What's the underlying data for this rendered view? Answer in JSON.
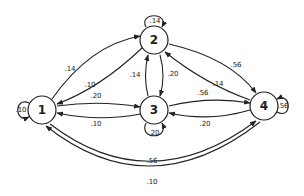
{
  "diagram": {
    "type": "markov-chain-state-transition",
    "nodes": [
      {
        "id": "1",
        "label": "1",
        "x": 42,
        "y": 110
      },
      {
        "id": "2",
        "label": "2",
        "x": 154,
        "y": 40
      },
      {
        "id": "3",
        "label": "3",
        "x": 154,
        "y": 110
      },
      {
        "id": "4",
        "label": "4",
        "x": 264,
        "y": 106
      }
    ],
    "edges": [
      {
        "from": "1",
        "to": "1",
        "label": ".10"
      },
      {
        "from": "1",
        "to": "2",
        "label": ".14"
      },
      {
        "from": "2",
        "to": "1",
        "label": ".10"
      },
      {
        "from": "1",
        "to": "3",
        "label": ".20"
      },
      {
        "from": "3",
        "to": "1",
        "label": ".10"
      },
      {
        "from": "2",
        "to": "2",
        "label": ".14"
      },
      {
        "from": "3",
        "to": "2",
        "label": ".14"
      },
      {
        "from": "2",
        "to": "3",
        "label": ".20"
      },
      {
        "from": "2",
        "to": "4",
        "label": ".56"
      },
      {
        "from": "4",
        "to": "2",
        "label": ".14"
      },
      {
        "from": "3",
        "to": "4",
        "label": ".56"
      },
      {
        "from": "4",
        "to": "3",
        "label": ".20"
      },
      {
        "from": "3",
        "to": "3",
        "label": ".20"
      },
      {
        "from": "4",
        "to": "4",
        "label": ".56"
      },
      {
        "from": "1",
        "to": "4",
        "label": ".56"
      },
      {
        "from": "4",
        "to": "1",
        "label": ".10"
      }
    ]
  },
  "labels": {
    "n1": "1",
    "n2": "2",
    "n3": "3",
    "n4": "4",
    "e11": ".10",
    "e12": ".14",
    "e21": ".10",
    "e13": ".20",
    "e31": ".10",
    "e22": ".14",
    "e32": ".14",
    "e23": ".20",
    "e24": ".56",
    "e42": ".14",
    "e34": ".56",
    "e43": ".20",
    "e33": ".20",
    "e44": ".56",
    "e14": ".56",
    "e41": ".10"
  }
}
